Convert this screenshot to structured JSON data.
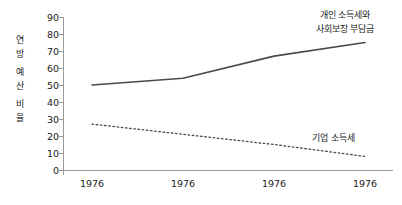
{
  "chart_data": {
    "type": "line",
    "title": "",
    "xlabel": "",
    "ylabel": "연방 예산 비율",
    "ylabel_syllables": [
      "연",
      "방",
      "예",
      "산",
      "비",
      "율"
    ],
    "categories": [
      "1976",
      "1976",
      "1976",
      "1976"
    ],
    "xticklabels": [
      "1976",
      "1976",
      "1976",
      "1976"
    ],
    "yticklabels": [
      "0",
      "10",
      "20",
      "30",
      "40",
      "50",
      "60",
      "70",
      "80",
      "90"
    ],
    "yticks": [
      0,
      10,
      20,
      30,
      40,
      50,
      60,
      70,
      80,
      90
    ],
    "ylim": [
      0,
      90
    ],
    "grid": false,
    "legend_position": "inline-annotation",
    "series": [
      {
        "name": "개인 소득세와 사회보장 부담금",
        "name_line1": "개인 소득세와",
        "name_line2": "사회보장 부담금",
        "style": "solid",
        "color": "#4a4a4a",
        "values": [
          50,
          54,
          67,
          75
        ]
      },
      {
        "name": "기업 소득세",
        "style": "dotted",
        "color": "#4a4a4a",
        "values": [
          27,
          21,
          15,
          8
        ]
      }
    ],
    "annotations": [
      {
        "text": "개인 소득세와 사회보장 부담금",
        "target_series": "개인 소득세와 사회보장 부담금"
      },
      {
        "text": "기업 소득세",
        "target_series": "기업 소득세"
      }
    ]
  },
  "colors": {
    "axis": "#9a9a9a",
    "line": "#4a4a4a",
    "text": "#1a1a1a",
    "background": "#ffffff"
  }
}
